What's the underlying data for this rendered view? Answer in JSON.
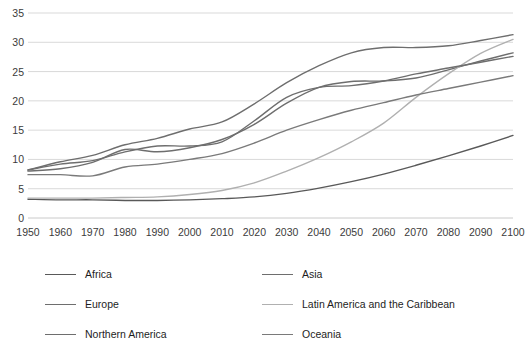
{
  "chart_data": {
    "type": "line",
    "title": "",
    "subtitle": "",
    "xlabel": "",
    "ylabel": "",
    "xlim": [
      1950,
      2100
    ],
    "ylim": [
      0,
      35
    ],
    "grid": true,
    "legend_position": "bottom",
    "x": [
      1950,
      1960,
      1970,
      1980,
      1990,
      2000,
      2010,
      2020,
      2030,
      2040,
      2050,
      2060,
      2070,
      2080,
      2090,
      2100
    ],
    "yticks": [
      0,
      5,
      10,
      15,
      20,
      25,
      30,
      35
    ],
    "xticks": [
      "1950",
      "1960",
      "1970",
      "1980",
      "1990",
      "2000",
      "2010",
      "2020",
      "2030",
      "2040",
      "2050",
      "2060",
      "2070",
      "2080",
      "2090",
      "2100"
    ],
    "series": [
      {
        "name": "Africa",
        "color": "#595959",
        "values": [
          3.2,
          3.1,
          3.1,
          3.0,
          3.0,
          3.1,
          3.3,
          3.6,
          4.2,
          5.1,
          6.2,
          7.5,
          9.0,
          10.6,
          12.3,
          14.1
        ]
      },
      {
        "name": "Asia",
        "color": "#6e6e6e",
        "values": [
          8.0,
          8.4,
          9.5,
          11.7,
          11.3,
          12.0,
          13.4,
          16.0,
          19.6,
          22.3,
          23.3,
          23.4,
          23.9,
          25.3,
          26.8,
          28.2
        ]
      },
      {
        "name": "Europe",
        "color": "#6e6e6e",
        "values": [
          8.2,
          9.6,
          10.7,
          12.5,
          13.6,
          15.2,
          16.4,
          19.5,
          23.1,
          26.0,
          28.2,
          29.1,
          29.1,
          29.4,
          30.3,
          31.3
        ]
      },
      {
        "name": "Latin America and the Caribbean",
        "color": "#b0b0b0",
        "values": [
          3.4,
          3.4,
          3.4,
          3.5,
          3.6,
          4.0,
          4.7,
          6.0,
          8.0,
          10.3,
          13.0,
          16.2,
          20.6,
          24.6,
          28.1,
          30.5
        ]
      },
      {
        "name": "Northern America",
        "color": "#6e6e6e",
        "values": [
          8.2,
          9.2,
          9.8,
          11.3,
          12.3,
          12.3,
          13.0,
          16.6,
          20.6,
          22.3,
          22.6,
          23.4,
          24.6,
          25.6,
          26.6,
          27.6
        ]
      },
      {
        "name": "Oceania",
        "color": "#7a7a7a",
        "values": [
          7.4,
          7.4,
          7.2,
          8.7,
          9.2,
          10.0,
          11.0,
          12.8,
          15.0,
          16.8,
          18.4,
          19.7,
          21.0,
          22.1,
          23.2,
          24.3
        ]
      }
    ]
  },
  "legend": {
    "items": [
      {
        "label": "Africa",
        "color": "#595959"
      },
      {
        "label": "Asia",
        "color": "#6e6e6e"
      },
      {
        "label": "Europe",
        "color": "#6e6e6e"
      },
      {
        "label": "Latin America and the Caribbean",
        "color": "#b0b0b0"
      },
      {
        "label": "Northern America",
        "color": "#6e6e6e"
      },
      {
        "label": "Oceania",
        "color": "#7a7a7a"
      }
    ]
  }
}
